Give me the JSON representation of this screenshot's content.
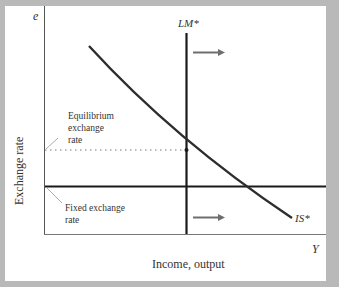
{
  "diagram": {
    "title": "",
    "y_axis": {
      "symbol": "e",
      "label": "Exchange rate"
    },
    "x_axis": {
      "symbol": "Y",
      "label": "Income, output"
    },
    "curves": {
      "lm": {
        "label": "LM*"
      },
      "is": {
        "label": "IS*"
      }
    },
    "annotations": {
      "equilibrium": [
        "Equilibrium",
        "exchange",
        "rate"
      ],
      "fixed": [
        "Fixed exchange",
        "rate"
      ]
    },
    "arrows": [
      {
        "name": "lm-shift-arrow",
        "direction": "right"
      },
      {
        "name": "is-shift-arrow",
        "direction": "right"
      }
    ],
    "colors": {
      "frame": "#b9b9b9",
      "line": "#1a1a1a",
      "curve": "#2d2d2d",
      "arrow": "#6e6e6e"
    }
  }
}
